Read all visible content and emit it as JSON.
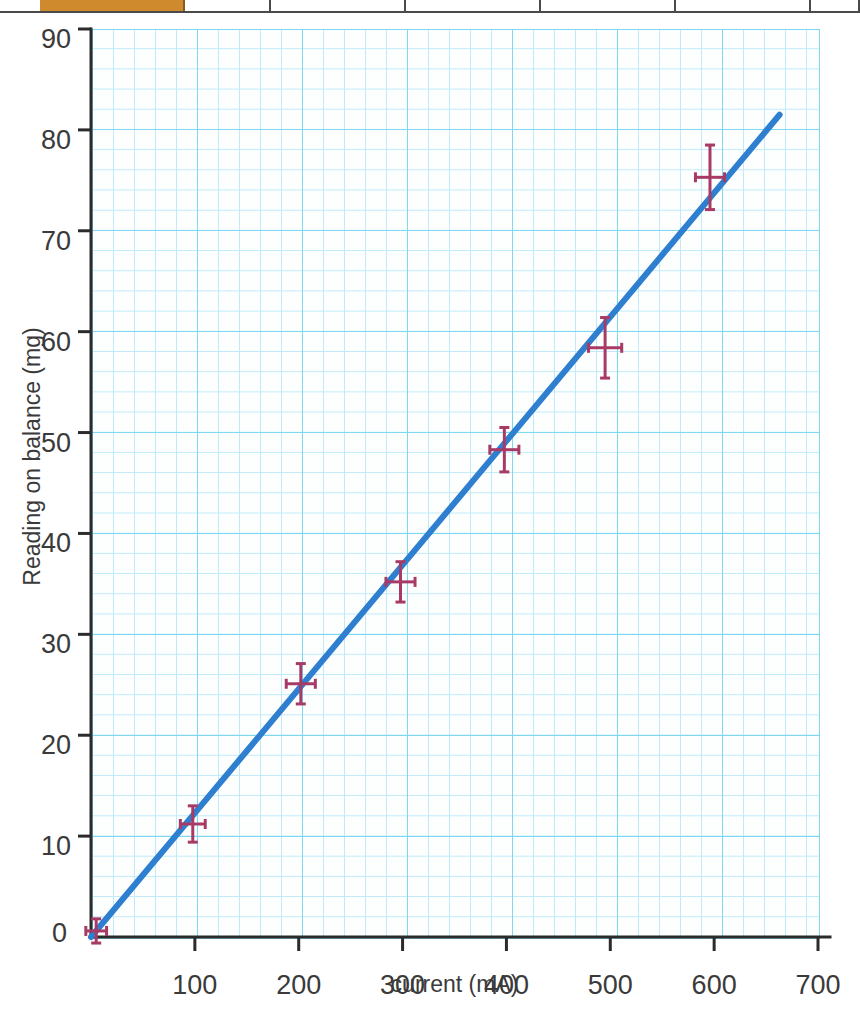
{
  "table_strip": {
    "cells": [
      {
        "name": "orange-header-cell",
        "left": 40,
        "width": 145,
        "accent": true,
        "text": ""
      },
      {
        "name": "header-cell-2",
        "left": 185,
        "width": 86,
        "accent": false,
        "text": ""
      },
      {
        "name": "header-cell-3",
        "left": 271,
        "width": 135,
        "accent": false,
        "text": ""
      },
      {
        "name": "header-cell-4",
        "left": 406,
        "width": 135,
        "accent": false,
        "text": ""
      },
      {
        "name": "header-cell-5",
        "left": 541,
        "width": 135,
        "accent": false,
        "text": ""
      },
      {
        "name": "header-cell-6",
        "left": 676,
        "width": 135,
        "accent": false,
        "text": ""
      },
      {
        "name": "header-cell-7",
        "left": 811,
        "width": 49,
        "accent": false,
        "text": ""
      }
    ]
  },
  "chart_data": {
    "type": "scatter",
    "title": "",
    "xlabel": "current (mA)",
    "ylabel": "Reading on balance (mg)",
    "xlim": [
      0,
      700
    ],
    "ylim": [
      0,
      90
    ],
    "xticks": [
      0,
      100,
      200,
      300,
      400,
      500,
      600,
      700
    ],
    "xtick_labels": [
      "0",
      "100",
      "200",
      "300",
      "400",
      "500",
      "600",
      "700"
    ],
    "yticks": [
      0,
      10,
      20,
      30,
      40,
      50,
      60,
      70,
      80,
      90
    ],
    "ytick_labels": [
      "0",
      "10",
      "20",
      "30",
      "40",
      "50",
      "60",
      "70",
      "80",
      "90"
    ],
    "grid": true,
    "grid_major_color": "#7fd8f2",
    "grid_minor_color": "#bfeaf9",
    "legend": "none",
    "series": [
      {
        "name": "measurements",
        "type": "scatter-errorbar",
        "color": "#a83a66",
        "points": [
          {
            "x": 5,
            "y": 0.6,
            "xerr": 10,
            "yerr": 1.2
          },
          {
            "x": 98,
            "y": 11.2,
            "xerr": 12,
            "yerr": 1.8
          },
          {
            "x": 202,
            "y": 25.1,
            "xerr": 14,
            "yerr": 2.0
          },
          {
            "x": 298,
            "y": 35.2,
            "xerr": 14,
            "yerr": 2.0
          },
          {
            "x": 398,
            "y": 48.3,
            "xerr": 14,
            "yerr": 2.2
          },
          {
            "x": 495,
            "y": 58.4,
            "xerr": 16,
            "yerr": 3.0
          },
          {
            "x": 596,
            "y": 75.3,
            "xerr": 14,
            "yerr": 3.2
          }
        ]
      },
      {
        "name": "line-of-best-fit",
        "type": "line",
        "color": "#2f7fd0",
        "x_start": 0,
        "y_start": 0,
        "x_end": 663,
        "y_end": 81.5
      }
    ]
  }
}
